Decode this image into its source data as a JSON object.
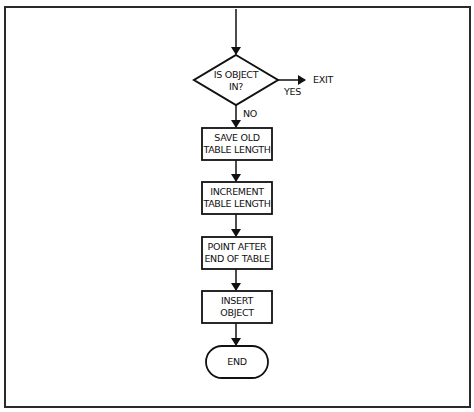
{
  "diagram": {
    "type": "flowchart",
    "decision": {
      "line1": "IS OBJECT",
      "line2": "IN?",
      "yes_label": "YES",
      "no_label": "NO",
      "exit_label": "EXIT"
    },
    "steps": [
      {
        "line1": "SAVE OLD",
        "line2": "TABLE LENGTH"
      },
      {
        "line1": "INCREMENT",
        "line2": "TABLE LENGTH"
      },
      {
        "line1": "POINT AFTER",
        "line2": "END OF TABLE"
      },
      {
        "line1": "INSERT",
        "line2": "OBJECT"
      }
    ],
    "terminal": {
      "label": "END"
    },
    "colors": {
      "stroke": "#111111",
      "background": "#ffffff"
    }
  }
}
